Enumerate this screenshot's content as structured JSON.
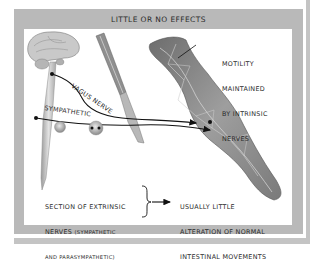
{
  "title": "LITTLE OR NO EFFECTS",
  "labels": {
    "vagus_nerve": "VAGUS NERVE",
    "sympathetic": "SYMPATHETIC",
    "motility": [
      "MOTILITY",
      "MAINTAINED",
      "BY INTRINSIC",
      "NERVES"
    ]
  },
  "caption": {
    "cause_line1": "SECTION OF EXTRINSIC",
    "cause_line2_main": "NERVES ",
    "cause_line2_small": "(SYMPATHETIC",
    "cause_line3_small": "AND PARASYMPATHETIC)",
    "effect": [
      "USUALLY LITTLE",
      "ALTERATION OF NORMAL",
      "INTESTINAL MOVEMENTS"
    ]
  },
  "elements": {
    "brain": "brain-and-spinal-cord",
    "scalpel": "scalpel",
    "intestine": "intestine-segment"
  },
  "colors": {
    "frame": "#b9b9b9",
    "panel": "#ffffff",
    "text": "#2a2a2a"
  }
}
